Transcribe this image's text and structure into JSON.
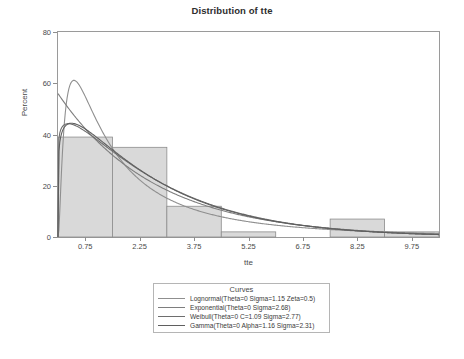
{
  "chart_data": {
    "type": "bar",
    "title": "Distribution of tte",
    "xlabel": "tte",
    "ylabel": "Percent",
    "xlim": [
      0,
      10.5
    ],
    "ylim": [
      0,
      80
    ],
    "grid": false,
    "legend_position": "below-plot",
    "xticks": [
      "0.75",
      "2.25",
      "3.75",
      "5.25",
      "6.75",
      "8.25",
      "9.75"
    ],
    "xtick_values": [
      0.75,
      2.25,
      3.75,
      5.25,
      6.75,
      8.25,
      9.75
    ],
    "yticks": [
      "0",
      "20",
      "40",
      "60",
      "80"
    ],
    "ytick_values": [
      0,
      20,
      40,
      60,
      80
    ],
    "bin_width": 1.5,
    "categories": [
      "0-1.5",
      "1.5-3.0",
      "3.0-4.5",
      "4.5-6.0",
      "6.0-7.5",
      "7.5-9.0",
      "9.0-10.5"
    ],
    "bin_starts": [
      0,
      1.5,
      3.0,
      4.5,
      6.0,
      7.5,
      9.0
    ],
    "values": [
      39,
      35,
      12,
      2,
      0,
      7,
      2
    ],
    "bar_fill": "#d9d9d9",
    "bar_edge": "#8c8c8c",
    "series": [
      {
        "name": "Lognormal(Theta=0 Sigma=1.15 Zeta=0.5)",
        "distribution": "Lognormal",
        "params": {
          "Theta": 0,
          "Sigma": 1.15,
          "Zeta": 0.5
        },
        "color": "#8f8f8f",
        "peak_percent": 61
      },
      {
        "name": "Exponential(Theta=0 Sigma=2.68)",
        "distribution": "Exponential",
        "params": {
          "Theta": 0,
          "Sigma": 2.68
        },
        "color": "#7e7e7e",
        "peak_percent": 56
      },
      {
        "name": "Weibull(Theta=0 C=1.09 Sigma=2.77)",
        "distribution": "Weibull",
        "params": {
          "Theta": 0,
          "C": 1.09,
          "Sigma": 2.77
        },
        "color": "#6e6e6e",
        "peak_percent": 44
      },
      {
        "name": "Gamma(Theta=0 Alpha=1.16 Sigma=2.31)",
        "distribution": "Gamma",
        "params": {
          "Theta": 0,
          "Alpha": 1.16,
          "Sigma": 2.31
        },
        "color": "#5f5f5f",
        "peak_percent": 44
      }
    ]
  },
  "legend": {
    "title": "Curves",
    "items": [
      "Lognormal(Theta=0 Sigma=1.15 Zeta=0.5)",
      "Exponential(Theta=0 Sigma=2.68)",
      "Weibull(Theta=0 C=1.09 Sigma=2.77)",
      "Gamma(Theta=0 Alpha=1.16 Sigma=2.31)"
    ]
  }
}
